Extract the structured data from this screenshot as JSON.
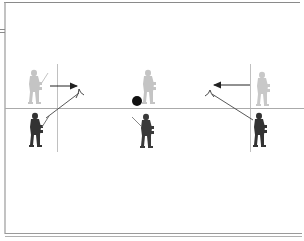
{
  "diagram": {
    "type": "lacrosse-drill",
    "colors": {
      "frame": "#9a9a9a",
      "frame_dark": "#7a7a7a",
      "line": "#a8a8a8",
      "arrow": "#222222",
      "ball": "#111111",
      "offense_player": "#b9b9b9",
      "offense_player_light": "#d4d4d4",
      "defense_player": "#2e2e2e",
      "defense_player_mid": "#555555"
    },
    "players": [
      {
        "id": "left-offense",
        "team": "light",
        "x": 36,
        "y": 68
      },
      {
        "id": "left-defense",
        "team": "dark",
        "x": 34,
        "y": 112
      },
      {
        "id": "center-offense",
        "team": "light",
        "x": 150,
        "y": 70
      },
      {
        "id": "center-defense",
        "team": "dark",
        "x": 142,
        "y": 113
      },
      {
        "id": "right-offense",
        "team": "light",
        "x": 265,
        "y": 70
      },
      {
        "id": "right-defense",
        "team": "dark",
        "x": 262,
        "y": 112
      }
    ],
    "ball": {
      "x": 137,
      "y": 101,
      "r": 5
    },
    "arrows": [
      {
        "id": "left-pass-arrow",
        "x1": 50,
        "y1": 86,
        "x2": 77,
        "y2": 86
      },
      {
        "id": "right-pass-arrow",
        "x1": 250,
        "y1": 85,
        "x2": 214,
        "y2": 85
      }
    ],
    "cuts": [
      {
        "id": "left-cut-line",
        "x1": 79,
        "y1": 93,
        "x2": 46,
        "y2": 118
      },
      {
        "id": "right-cut-line",
        "x1": 212,
        "y1": 94,
        "x2": 253,
        "y2": 120
      }
    ],
    "markers": [
      {
        "id": "left-cone-marker",
        "x": 79,
        "y": 90
      },
      {
        "id": "right-cone-marker",
        "x": 210,
        "y": 91
      }
    ]
  }
}
